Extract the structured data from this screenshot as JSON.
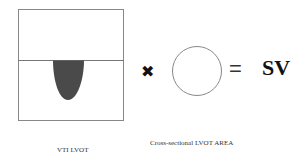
{
  "diagram": {
    "vti_panel": {
      "label": "VTI LVOT",
      "baseline": "horizontal-baseline",
      "waveform": "doppler-envelope"
    },
    "operator_multiply": "✖",
    "area_panel": {
      "label": "Cross-sectional LVOT AREA",
      "shape": "circle"
    },
    "operator_equals": "=",
    "result": "SV",
    "colors": {
      "stroke": "#777777",
      "waveform_fill": "#4a4a4a",
      "text": "#111111"
    }
  }
}
